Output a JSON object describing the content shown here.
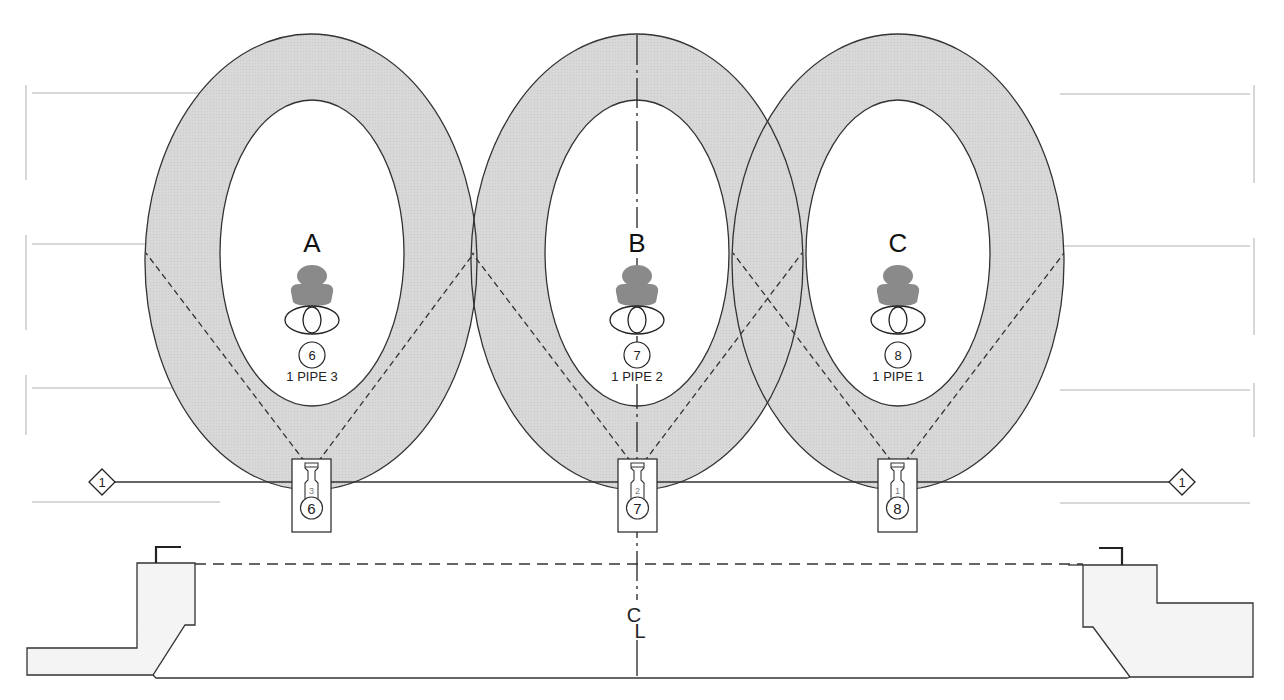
{
  "diagram": {
    "type": "stage lighting plot (front view)",
    "colors": {
      "coverage_fill": "#d6d6d6",
      "stroke": "#333333",
      "figure_fill": "#8a8a8a",
      "guide_lines": "#b0b0b0",
      "stage_fill": "#f4f4f4"
    },
    "areas": [
      {
        "letter": "A",
        "channel": "6",
        "pipe_label": "1 PIPE 3",
        "unit_number": "3",
        "unit_channel": "6",
        "cx": 311
      },
      {
        "letter": "B",
        "channel": "7",
        "pipe_label": "1 PIPE 2",
        "unit_number": "2",
        "unit_channel": "7",
        "cx": 637
      },
      {
        "letter": "C",
        "channel": "8",
        "pipe_label": "1 PIPE 1",
        "unit_number": "1",
        "unit_channel": "8",
        "cx": 898
      }
    ],
    "pipe": {
      "left_tag": "1",
      "right_tag": "1"
    },
    "centerline_label": "C̲L",
    "centerline_symbol_top": "C",
    "centerline_symbol_bottom": "L"
  }
}
